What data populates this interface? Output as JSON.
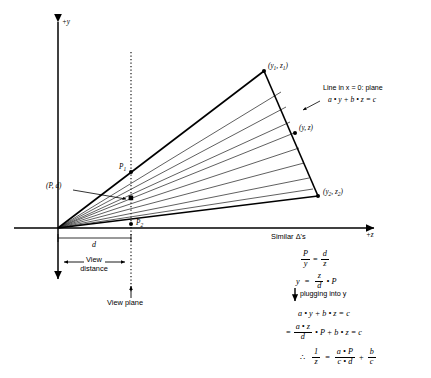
{
  "figure": {
    "title_hidden": "",
    "axes": {
      "y_axis_label": "+y",
      "z_axis_label": "+z"
    },
    "points": {
      "p1": "P",
      "p1_sub": "1",
      "p_d": "(P, d)",
      "p2": "P",
      "p2_sub": "2",
      "vertex_top": "(y",
      "vertex_top_sub1": "1",
      "vertex_top_mid": ", z",
      "vertex_top_sub2": "1",
      "vertex_top_end": ")",
      "vertex_mid": "(y, z)",
      "vertex_bottom": "(y",
      "vertex_bottom_sub1": "2",
      "vertex_bottom_mid": ", z",
      "vertex_bottom_sub2": "2",
      "vertex_bottom_end": ")"
    },
    "annotations": {
      "line_in_plane": "Line in x = 0: plane",
      "plane_equation": "a • y + b • z = c",
      "distance_symbol": "d",
      "view_distance_line1": "View",
      "view_distance_line2": "distance",
      "view_plane": "View plane",
      "similar_triangles": "Similar Δ's",
      "plugging_into": "plugging into y"
    },
    "derivation": {
      "eq1": {
        "left_num": "P",
        "left_den": "y",
        "operator": "=",
        "right_num": "d",
        "right_den": "z"
      },
      "eq2": {
        "lhs": "y",
        "operator": "=",
        "num": "z",
        "den": "d",
        "tail": "• P"
      },
      "eq3": "a • y + b • z = c",
      "eq4": {
        "operator": "=",
        "num": "a • z",
        "den": "d",
        "tail": "• P + b • z = c"
      },
      "eq5": {
        "therefore": "∴",
        "lhs_num": "1",
        "lhs_den": "z",
        "operator": "=",
        "t1_num": "a • P",
        "t1_den": "c • d",
        "plus": "+",
        "t2_num": "b",
        "t2_den": "c"
      }
    },
    "colors": {
      "stroke": "#000000",
      "thin_stroke": "#3a3a3a",
      "background": "#ffffff"
    }
  }
}
